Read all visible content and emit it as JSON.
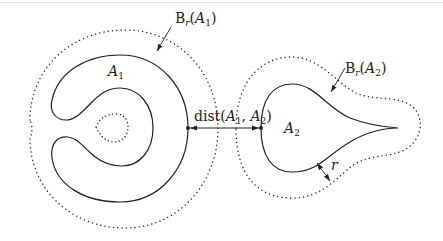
{
  "figure": {
    "type": "set-distance-diagram",
    "sets": [
      {
        "name": "A1",
        "label_main": "A",
        "label_sub": "1",
        "shape": "C-shaped annulus"
      },
      {
        "name": "A2",
        "label_main": "A",
        "label_sub": "2",
        "shape": "teardrop"
      }
    ],
    "neighborhoods": [
      {
        "label_prefix": "B",
        "label_sub": "r",
        "label_arg_main": "A",
        "label_arg_sub": "1",
        "style": "dotted"
      },
      {
        "label_prefix": "B",
        "label_sub": "r",
        "label_arg_main": "A",
        "label_arg_sub": "2",
        "style": "dotted"
      }
    ],
    "distance": {
      "fn": "dist",
      "arg1_main": "A",
      "arg1_sub": "1",
      "arg2_main": "A",
      "arg2_sub": "2"
    },
    "radius": {
      "label": "r"
    }
  },
  "colors": {
    "stroke": "#222222",
    "background": "#ffffff"
  }
}
